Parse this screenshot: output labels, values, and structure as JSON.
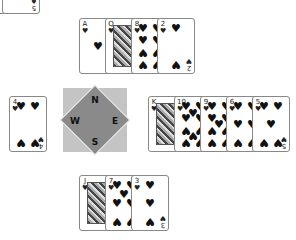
{
  "game": "Hearts card game",
  "compass": {
    "north": "N",
    "east": "E",
    "south": "S",
    "west": "W"
  },
  "corner_stack": {
    "cards": [
      {
        "rank": "J",
        "suit": "♠"
      },
      {
        "rank": "5",
        "suit": "♠"
      }
    ]
  },
  "hands": {
    "north": [
      {
        "rank": "A",
        "suit": "♥",
        "pips": 1
      },
      {
        "rank": "Q",
        "suit": "♥",
        "face": true
      },
      {
        "rank": "8",
        "suit": "♥",
        "pips": 8
      },
      {
        "rank": "2",
        "suit": "♥",
        "pips": 2
      }
    ],
    "west": [
      {
        "rank": "4",
        "suit": "♥",
        "pips": 4
      }
    ],
    "east": [
      {
        "rank": "K",
        "suit": "♥",
        "face": true
      },
      {
        "rank": "10",
        "suit": "♥",
        "pips": 10
      },
      {
        "rank": "9",
        "suit": "♥",
        "pips": 9
      },
      {
        "rank": "6",
        "suit": "♥",
        "pips": 6
      },
      {
        "rank": "5",
        "suit": "♥",
        "pips": 5
      }
    ],
    "south": [
      {
        "rank": "J",
        "suit": "♥",
        "face": true
      },
      {
        "rank": "7",
        "suit": "♥",
        "pips": 7
      },
      {
        "rank": "3",
        "suit": "♥",
        "pips": 3
      }
    ]
  }
}
